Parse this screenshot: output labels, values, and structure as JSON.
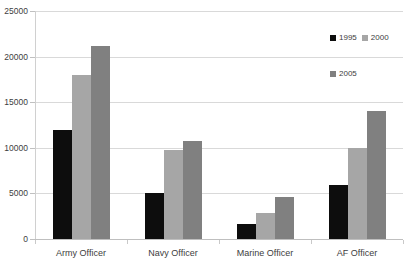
{
  "chart_data": {
    "type": "bar",
    "title": "",
    "xlabel": "",
    "ylabel": "",
    "ylim": [
      0,
      25000
    ],
    "ytick_labels": [
      "0",
      "5000",
      "10000",
      "15000",
      "20000",
      "25000"
    ],
    "ytick_values": [
      0,
      5000,
      10000,
      15000,
      20000,
      25000
    ],
    "grid": true,
    "legend_position": "top-right",
    "categories": [
      "Army Officer",
      "Navy Officer",
      "Marine Officer",
      "AF Officer"
    ],
    "series": [
      {
        "name": "1995",
        "color": "#0d0d0d",
        "values": [
          12000,
          5100,
          1600,
          5900
        ]
      },
      {
        "name": "2000",
        "color": "#a6a6a6",
        "values": [
          18000,
          9800,
          2900,
          10000
        ]
      },
      {
        "name": "2005",
        "color": "#808080",
        "values": [
          21200,
          10700,
          4600,
          14000
        ]
      }
    ]
  },
  "legend": {
    "entries": [
      {
        "label": "1995",
        "color": "#0d0d0d"
      },
      {
        "label": "2000",
        "color": "#a6a6a6"
      },
      {
        "label": "2005",
        "color": "#808080"
      }
    ]
  },
  "axis": {
    "y_labels": [
      "25000",
      "20000",
      "15000",
      "10000",
      "5000",
      "0"
    ],
    "x_labels": [
      "Army Officer",
      "Navy Officer",
      "Marine Officer",
      "AF Officer"
    ]
  }
}
